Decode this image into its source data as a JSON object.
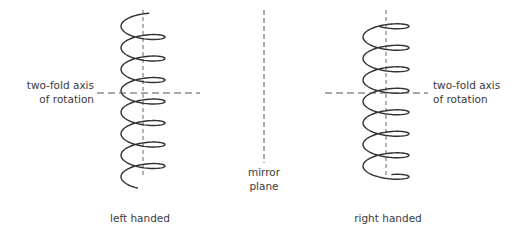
{
  "diagram": {
    "colors": {
      "stroke": "#333333",
      "text": "#3a3a3a",
      "background": "#ffffff"
    },
    "left_helix": {
      "handedness_label": "left handed",
      "axis_label_line1": "two-fold axis",
      "axis_label_line2": "of rotation",
      "axis_x": 143,
      "axis_y_top": 10,
      "axis_y_bottom": 175,
      "rotation_axis_y": 93,
      "rotation_axis_x_start": 97,
      "rotation_axis_x_end": 200,
      "radius": 22,
      "ellipse_minor": 7,
      "pitch": 21.5,
      "turns": 7.5,
      "y_start": 20,
      "direction": -1
    },
    "right_helix": {
      "handedness_label": "right handed",
      "axis_label_line1": "two-fold axis",
      "axis_label_line2": "of rotation",
      "axis_x": 386,
      "axis_y_top": 10,
      "axis_y_bottom": 175,
      "rotation_axis_y": 93,
      "rotation_axis_x_start": 325,
      "rotation_axis_x_end": 428,
      "radius": 23,
      "ellipse_minor": 7,
      "pitch": 21.5,
      "turns": 7.5,
      "y_start": 20,
      "direction": 1
    },
    "mirror_plane": {
      "label_line1": "mirror",
      "label_line2": "plane",
      "x": 264,
      "y_top": 10,
      "y_bottom": 163
    }
  }
}
